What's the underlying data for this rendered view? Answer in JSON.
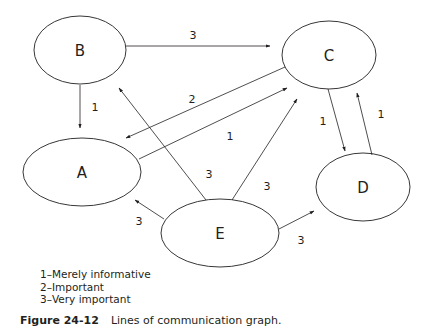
{
  "nodes": [
    {
      "id": "B",
      "label": "B",
      "cx": 80,
      "cy": 50,
      "rx": 46,
      "ry": 34
    },
    {
      "id": "C",
      "label": "C",
      "cx": 329,
      "cy": 55,
      "rx": 47,
      "ry": 34
    },
    {
      "id": "A",
      "label": "A",
      "cx": 82,
      "cy": 172,
      "rx": 59,
      "ry": 34
    },
    {
      "id": "D",
      "label": "D",
      "cx": 363,
      "cy": 187,
      "rx": 47,
      "ry": 34
    },
    {
      "id": "E",
      "label": "E",
      "cx": 220,
      "cy": 233,
      "rx": 59,
      "ry": 34
    }
  ],
  "edges": [
    {
      "from": "B",
      "to": "C",
      "weight": "3"
    },
    {
      "from": "B",
      "to": "A",
      "weight": "1"
    },
    {
      "from": "C",
      "to": "A",
      "weight": "2"
    },
    {
      "from": "A",
      "to": "C",
      "weight": "1"
    },
    {
      "from": "E",
      "to": "B",
      "weight": "3"
    },
    {
      "from": "E",
      "to": "C",
      "weight": "3"
    },
    {
      "from": "E",
      "to": "A",
      "weight": "3"
    },
    {
      "from": "E",
      "to": "D",
      "weight": "3"
    },
    {
      "from": "C",
      "to": "D",
      "weight": "1"
    },
    {
      "from": "D",
      "to": "C",
      "weight": "1"
    }
  ],
  "legend": [
    "1–Merely informative",
    "2–Important",
    "3–Very important"
  ],
  "caption": {
    "figure": "Figure 24-12",
    "text": "Lines of communication graph."
  }
}
